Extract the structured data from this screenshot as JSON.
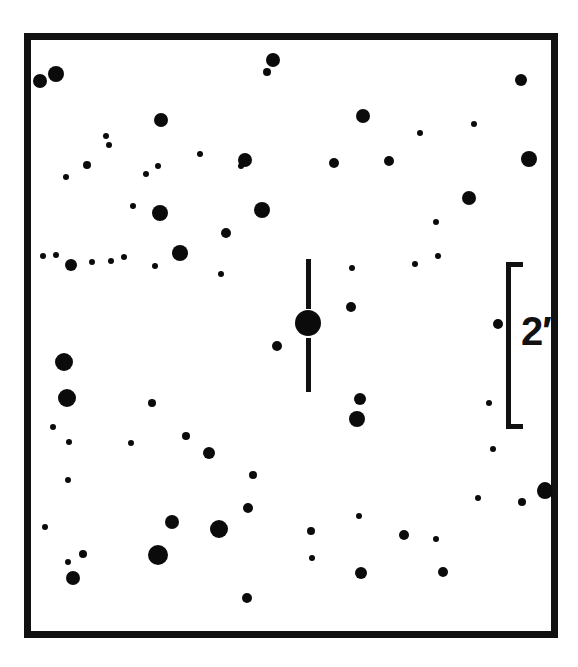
{
  "chart_data": {
    "type": "scatter",
    "title": "",
    "subtitle": "",
    "xlabel": "",
    "ylabel": "",
    "grid": false,
    "legend": null,
    "frame": {
      "x": 24,
      "y": 33,
      "width": 534,
      "height": 605,
      "border_width": 7,
      "border_color": "#111111",
      "background": "#ffffff"
    },
    "symbol_color": "#0b0b0b",
    "background_color": "#ffffff",
    "scale_bar": {
      "label": "2′",
      "value": 2,
      "unit": "arcmin",
      "orientation": "vertical",
      "bracket_x": 506,
      "bracket_y": 262,
      "bracket_width": 17,
      "bracket_height": 167,
      "label_x": 521,
      "label_y": 311
    },
    "target_marker": {
      "type": "vertical-ticks",
      "x": 308,
      "y": 323,
      "tick_top": {
        "x": 306,
        "y": 259,
        "width": 5,
        "height": 50
      },
      "tick_bottom": {
        "x": 306,
        "y": 338,
        "width": 5,
        "height": 54
      }
    },
    "target_star": {
      "x": 308,
      "y": 323,
      "r": 13
    },
    "stars": [
      {
        "x": 56,
        "y": 74,
        "r": 8
      },
      {
        "x": 40,
        "y": 81,
        "r": 7
      },
      {
        "x": 273,
        "y": 60,
        "r": 7
      },
      {
        "x": 267,
        "y": 72,
        "r": 4
      },
      {
        "x": 521,
        "y": 80,
        "r": 6
      },
      {
        "x": 161,
        "y": 120,
        "r": 7
      },
      {
        "x": 363,
        "y": 116,
        "r": 7
      },
      {
        "x": 474,
        "y": 124,
        "r": 3
      },
      {
        "x": 109,
        "y": 145,
        "r": 3
      },
      {
        "x": 245,
        "y": 160,
        "r": 7
      },
      {
        "x": 241,
        "y": 166,
        "r": 3
      },
      {
        "x": 334,
        "y": 163,
        "r": 5
      },
      {
        "x": 389,
        "y": 161,
        "r": 5
      },
      {
        "x": 529,
        "y": 159,
        "r": 8
      },
      {
        "x": 87,
        "y": 165,
        "r": 4
      },
      {
        "x": 66,
        "y": 177,
        "r": 3
      },
      {
        "x": 158,
        "y": 166,
        "r": 3
      },
      {
        "x": 200,
        "y": 154,
        "r": 3
      },
      {
        "x": 420,
        "y": 133,
        "r": 3
      },
      {
        "x": 146,
        "y": 174,
        "r": 3
      },
      {
        "x": 133,
        "y": 206,
        "r": 3
      },
      {
        "x": 160,
        "y": 213,
        "r": 8
      },
      {
        "x": 262,
        "y": 210,
        "r": 8
      },
      {
        "x": 469,
        "y": 198,
        "r": 7
      },
      {
        "x": 226,
        "y": 233,
        "r": 5
      },
      {
        "x": 180,
        "y": 253,
        "r": 8
      },
      {
        "x": 43,
        "y": 256,
        "r": 3
      },
      {
        "x": 56,
        "y": 255,
        "r": 3
      },
      {
        "x": 71,
        "y": 265,
        "r": 6
      },
      {
        "x": 92,
        "y": 262,
        "r": 3
      },
      {
        "x": 111,
        "y": 261,
        "r": 3
      },
      {
        "x": 124,
        "y": 257,
        "r": 3
      },
      {
        "x": 155,
        "y": 266,
        "r": 3
      },
      {
        "x": 221,
        "y": 274,
        "r": 3
      },
      {
        "x": 436,
        "y": 222,
        "r": 3
      },
      {
        "x": 438,
        "y": 256,
        "r": 3
      },
      {
        "x": 352,
        "y": 268,
        "r": 3
      },
      {
        "x": 351,
        "y": 307,
        "r": 5
      },
      {
        "x": 277,
        "y": 346,
        "r": 5
      },
      {
        "x": 498,
        "y": 324,
        "r": 5
      },
      {
        "x": 64,
        "y": 362,
        "r": 9
      },
      {
        "x": 67,
        "y": 398,
        "r": 9
      },
      {
        "x": 53,
        "y": 427,
        "r": 3
      },
      {
        "x": 152,
        "y": 403,
        "r": 4
      },
      {
        "x": 360,
        "y": 399,
        "r": 6
      },
      {
        "x": 357,
        "y": 419,
        "r": 8
      },
      {
        "x": 131,
        "y": 443,
        "r": 3
      },
      {
        "x": 186,
        "y": 436,
        "r": 4
      },
      {
        "x": 209,
        "y": 453,
        "r": 6
      },
      {
        "x": 68,
        "y": 480,
        "r": 3
      },
      {
        "x": 493,
        "y": 449,
        "r": 3
      },
      {
        "x": 45,
        "y": 527,
        "r": 3
      },
      {
        "x": 489,
        "y": 403,
        "r": 3
      },
      {
        "x": 253,
        "y": 475,
        "r": 4
      },
      {
        "x": 69,
        "y": 442,
        "r": 3
      },
      {
        "x": 545,
        "y": 491,
        "r": 8
      },
      {
        "x": 545,
        "y": 489,
        "r": 7
      },
      {
        "x": 522,
        "y": 502,
        "r": 4
      },
      {
        "x": 248,
        "y": 508,
        "r": 5
      },
      {
        "x": 172,
        "y": 522,
        "r": 7
      },
      {
        "x": 219,
        "y": 529,
        "r": 9
      },
      {
        "x": 158,
        "y": 555,
        "r": 10
      },
      {
        "x": 311,
        "y": 531,
        "r": 4
      },
      {
        "x": 312,
        "y": 558,
        "r": 3
      },
      {
        "x": 404,
        "y": 535,
        "r": 5
      },
      {
        "x": 436,
        "y": 539,
        "r": 3
      },
      {
        "x": 73,
        "y": 578,
        "r": 7
      },
      {
        "x": 83,
        "y": 554,
        "r": 4
      },
      {
        "x": 68,
        "y": 562,
        "r": 3
      },
      {
        "x": 247,
        "y": 598,
        "r": 5
      },
      {
        "x": 361,
        "y": 573,
        "r": 6
      },
      {
        "x": 443,
        "y": 572,
        "r": 5
      },
      {
        "x": 478,
        "y": 498,
        "r": 3
      },
      {
        "x": 359,
        "y": 516,
        "r": 3
      },
      {
        "x": 106,
        "y": 136,
        "r": 3
      },
      {
        "x": 415,
        "y": 264,
        "r": 3
      }
    ]
  },
  "figure": {
    "caption": ""
  }
}
